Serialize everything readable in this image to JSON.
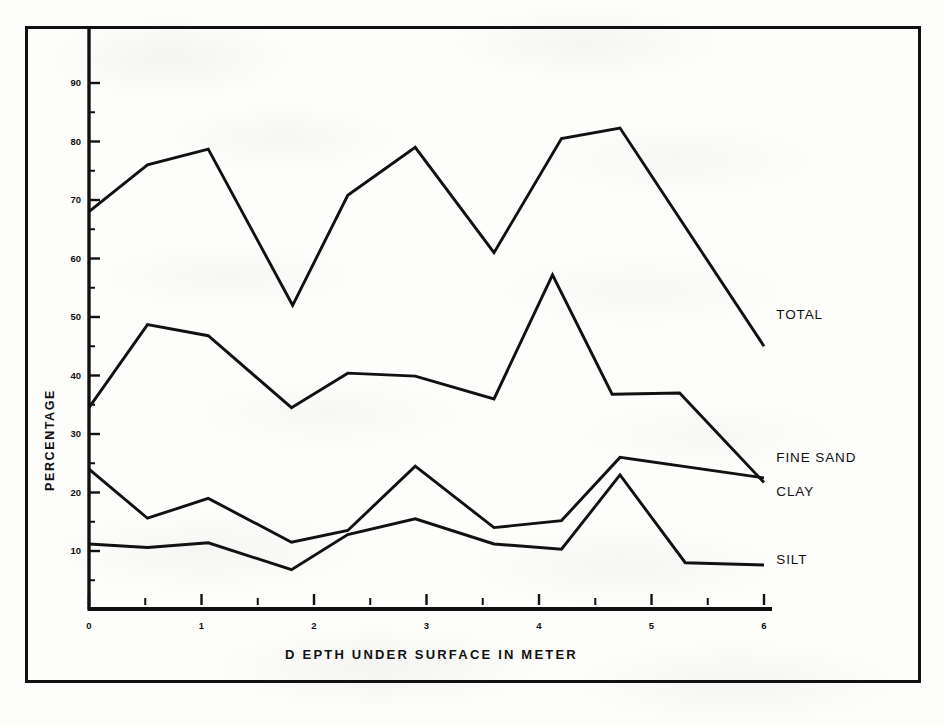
{
  "figure": {
    "background_color": "#fdfdfc",
    "ink_color": "#111111",
    "frame": {
      "label": "figure-border"
    }
  },
  "chart_data": {
    "type": "line",
    "title": "",
    "subtitle": "",
    "xlabel": "D EPTH   UNDER  SURFACE     IN  METER",
    "ylabel": "PERCENTAGE",
    "xlim": [
      0,
      6
    ],
    "ylim": [
      0,
      95
    ],
    "x_ticks": [
      0,
      1,
      2,
      3,
      4,
      5,
      6
    ],
    "x_tick_labels": [
      "0",
      "1",
      "2",
      "3",
      "4",
      "5",
      "6"
    ],
    "x_minor_ticks": [
      0.5,
      1.5,
      2.5,
      3.5,
      4.5,
      5.5
    ],
    "y_ticks": [
      10,
      20,
      30,
      40,
      50,
      60,
      70,
      80,
      90
    ],
    "y_tick_labels": [
      "10",
      "20",
      "30",
      "40",
      "50",
      "60",
      "70",
      "80",
      "90"
    ],
    "y_minor_ticks": [
      5,
      15,
      25,
      35,
      45,
      55,
      65,
      75,
      85
    ],
    "grid": false,
    "legend_position": "inline-right-end-labels",
    "series": [
      {
        "name": "TOTAL",
        "label": "TOTAL",
        "label_x": 6.02,
        "label_y": 50.5,
        "points": [
          [
            0.0,
            68.0
          ],
          [
            0.52,
            76.0
          ],
          [
            1.06,
            78.7
          ],
          [
            1.81,
            52.0
          ],
          [
            2.3,
            70.8
          ],
          [
            2.9,
            79.0
          ],
          [
            3.6,
            61.0
          ],
          [
            4.2,
            80.5
          ],
          [
            4.72,
            82.3
          ],
          [
            6.0,
            45.0
          ]
        ]
      },
      {
        "name": "FINE SAND",
        "label": "FINE SAND",
        "label_x": 6.02,
        "label_y": 26.0,
        "points": [
          [
            0.0,
            34.5
          ],
          [
            0.52,
            48.7
          ],
          [
            1.06,
            46.8
          ],
          [
            1.8,
            34.5
          ],
          [
            2.3,
            40.4
          ],
          [
            2.9,
            39.9
          ],
          [
            3.6,
            36.0
          ],
          [
            4.12,
            57.2
          ],
          [
            4.65,
            36.8
          ],
          [
            5.25,
            37.0
          ],
          [
            6.0,
            21.7
          ]
        ]
      },
      {
        "name": "CLAY",
        "label": "CLAY",
        "label_x": 6.02,
        "label_y": 20.2,
        "points": [
          [
            0.0,
            24.0
          ],
          [
            0.52,
            15.6
          ],
          [
            1.06,
            19.0
          ],
          [
            1.8,
            11.5
          ],
          [
            2.3,
            13.5
          ],
          [
            2.9,
            24.5
          ],
          [
            3.6,
            14.0
          ],
          [
            4.2,
            15.2
          ],
          [
            4.72,
            26.0
          ],
          [
            6.0,
            22.5
          ]
        ]
      },
      {
        "name": "SILT",
        "label": "SILT",
        "label_x": 6.02,
        "label_y": 8.6,
        "points": [
          [
            0.0,
            11.2
          ],
          [
            0.52,
            10.6
          ],
          [
            1.06,
            11.4
          ],
          [
            1.8,
            6.8
          ],
          [
            2.3,
            12.8
          ],
          [
            2.9,
            15.5
          ],
          [
            3.6,
            11.2
          ],
          [
            4.2,
            10.3
          ],
          [
            4.72,
            23.0
          ],
          [
            5.3,
            8.0
          ],
          [
            6.0,
            7.6
          ]
        ]
      }
    ]
  }
}
